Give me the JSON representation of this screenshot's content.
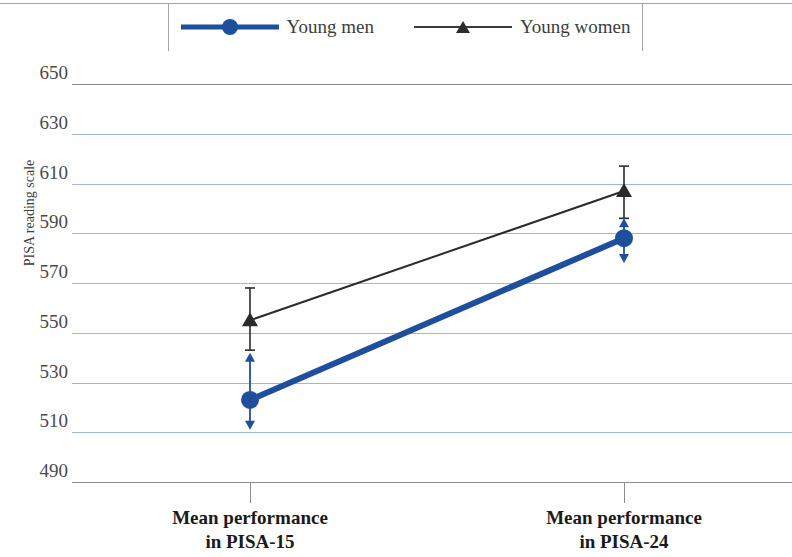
{
  "chart_data": {
    "type": "line",
    "title": "",
    "xlabel": "",
    "ylabel": "PISA reading scale",
    "categories": [
      "Mean performance\nin PISA-15",
      "Mean performance\nin PISA-24"
    ],
    "ylim": [
      490,
      650
    ],
    "ytick_values": [
      650,
      630,
      610,
      590,
      570,
      550,
      530,
      510,
      490
    ],
    "grid": true,
    "legend_position": "top-center",
    "series": [
      {
        "name": "Young men",
        "color": "#1f4e9c",
        "marker": "circle",
        "values": [
          523,
          588
        ],
        "error_low": [
          511,
          578
        ],
        "error_high": [
          542,
          596
        ]
      },
      {
        "name": "Young women",
        "color": "#2b2b2b",
        "marker": "triangle",
        "values": [
          555,
          607
        ],
        "error_low": [
          543,
          596
        ],
        "error_high": [
          568,
          617
        ]
      }
    ]
  },
  "axis": {
    "y_title": "PISA reading scale",
    "y_ticks": [
      "650",
      "630",
      "610",
      "590",
      "570",
      "550",
      "530",
      "510",
      "490"
    ],
    "x_categories": [
      {
        "line1": "Mean performance",
        "line2": "in PISA-15"
      },
      {
        "line1": "Mean performance",
        "line2": "in PISA-24"
      }
    ]
  },
  "legend": {
    "entries": [
      {
        "label": "Young men",
        "color": "#1f4e9c",
        "marker": "circle"
      },
      {
        "label": "Young women",
        "color": "#2b2b2b",
        "marker": "triangle"
      }
    ]
  },
  "colors": {
    "men": "#1f4e9c",
    "women": "#2b2b2b",
    "grid": "#9db8d8",
    "axis": "#8c8c8c"
  }
}
